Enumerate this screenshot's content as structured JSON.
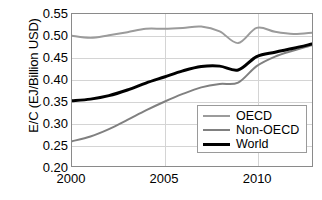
{
  "chart_data": {
    "type": "line",
    "title": "",
    "xlabel": "",
    "ylabel": "E/C (EJ/Billion USD)",
    "xlim": [
      2000,
      2013
    ],
    "ylim": [
      0.2,
      0.55
    ],
    "xticks": [
      "2000",
      "2005",
      "2010"
    ],
    "xtick_values": [
      2000,
      2005,
      2010
    ],
    "yticks": [
      "0.20",
      "0.25",
      "0.30",
      "0.35",
      "0.40",
      "0.45",
      "0.50",
      "0.55"
    ],
    "ytick_values": [
      0.2,
      0.25,
      0.3,
      0.35,
      0.4,
      0.45,
      0.5,
      0.55
    ],
    "grid": "horizontal-and-vertical-at-ticks",
    "legend_position": "lower-right-inside",
    "x": [
      2000,
      2001,
      2002,
      2003,
      2004,
      2005,
      2006,
      2007,
      2008,
      2009,
      2010,
      2011,
      2012,
      2013
    ],
    "series": [
      {
        "name": "OECD",
        "color": "#9b9b9b",
        "width": 2,
        "values": [
          0.5,
          0.495,
          0.501,
          0.508,
          0.516,
          0.516,
          0.518,
          0.521,
          0.51,
          0.483,
          0.518,
          0.509,
          0.504,
          0.507
        ]
      },
      {
        "name": "Non-OECD",
        "color": "#808080",
        "width": 2,
        "values": [
          0.257,
          0.268,
          0.285,
          0.306,
          0.328,
          0.348,
          0.366,
          0.381,
          0.389,
          0.392,
          0.43,
          0.452,
          0.466,
          0.478
        ]
      },
      {
        "name": "World",
        "color": "#000000",
        "width": 3,
        "values": [
          0.35,
          0.354,
          0.362,
          0.375,
          0.391,
          0.405,
          0.419,
          0.429,
          0.43,
          0.421,
          0.452,
          0.462,
          0.471,
          0.481
        ]
      }
    ],
    "legend_entries": [
      {
        "label": "OECD",
        "color": "#9b9b9b",
        "width": 2
      },
      {
        "label": "Non-OECD",
        "color": "#808080",
        "width": 2
      },
      {
        "label": "World",
        "color": "#000000",
        "width": 3
      }
    ]
  }
}
